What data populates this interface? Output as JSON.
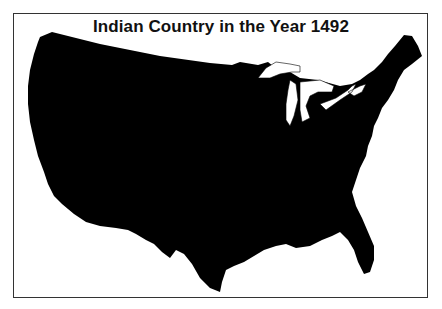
{
  "title": "Indian Country in the Year 1492",
  "map": {
    "region": "contiguous United States",
    "fill_color": "#000000",
    "background_color": "#ffffff",
    "features": [
      "Great Lakes (white)"
    ]
  }
}
